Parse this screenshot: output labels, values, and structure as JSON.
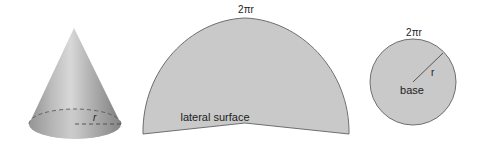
{
  "figure": {
    "cone": {
      "radius_label": "r"
    },
    "lateral_surface": {
      "arc_label": "2πr",
      "caption": "lateral surface"
    },
    "base": {
      "circumference_label": "2πr",
      "radius_label": "r",
      "caption": "base"
    }
  },
  "colors": {
    "fill_gray": "#c9c9c9",
    "outline": "#6e6e6e",
    "text": "#222222",
    "background": "#ffffff"
  }
}
